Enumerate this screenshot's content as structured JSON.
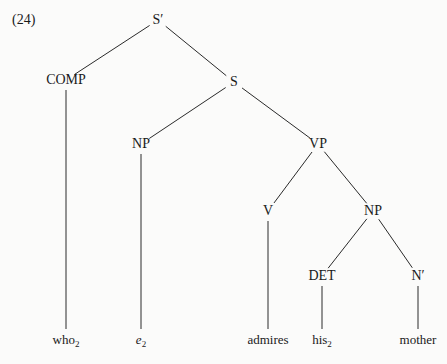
{
  "example_label": "(24)",
  "nodes": {
    "sbar": {
      "label": "S′",
      "x": 158,
      "y": 20
    },
    "comp": {
      "label": "COMP",
      "x": 66,
      "y": 80
    },
    "s": {
      "label": "S",
      "x": 234,
      "y": 82
    },
    "np1": {
      "label": "NP",
      "x": 141,
      "y": 144
    },
    "vp": {
      "label": "VP",
      "x": 318,
      "y": 144
    },
    "v": {
      "label": "V",
      "x": 268,
      "y": 211
    },
    "np2": {
      "label": "NP",
      "x": 373,
      "y": 211
    },
    "det": {
      "label": "DET",
      "x": 322,
      "y": 276
    },
    "nbar": {
      "label": "N′",
      "x": 418,
      "y": 276
    }
  },
  "leaves": [
    {
      "word": "who",
      "sub": "2",
      "italic": false,
      "x": 66,
      "y": 339
    },
    {
      "word": "e",
      "sub": "2",
      "italic": true,
      "x": 141,
      "y": 339
    },
    {
      "word": "admires",
      "sub": "",
      "italic": false,
      "x": 268,
      "y": 339
    },
    {
      "word": "his",
      "sub": "2",
      "italic": false,
      "x": 322,
      "y": 339
    },
    {
      "word": "mother",
      "sub": "",
      "italic": false,
      "x": 418,
      "y": 339
    }
  ],
  "edges": [
    [
      "sbar",
      "comp"
    ],
    [
      "sbar",
      "s"
    ],
    [
      "s",
      "np1"
    ],
    [
      "s",
      "vp"
    ],
    [
      "vp",
      "v"
    ],
    [
      "vp",
      "np2"
    ],
    [
      "np2",
      "det"
    ],
    [
      "np2",
      "nbar"
    ]
  ],
  "terminal_edges": [
    [
      "comp",
      0
    ],
    [
      "np1",
      1
    ],
    [
      "v",
      2
    ],
    [
      "det",
      3
    ],
    [
      "nbar",
      4
    ]
  ],
  "line_color": "#2a2a2a"
}
